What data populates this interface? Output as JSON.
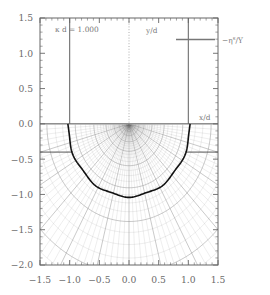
{
  "figure": {
    "kind": "scientific-plot",
    "background_color": "#ffffff",
    "frame_color": "#666666",
    "mesh_color": "#8a8a8a",
    "boundary_color": "#111111",
    "annotations": {
      "kappa_d": "κ d  =  1.000",
      "y_axis_name": "y/d",
      "x_axis_name": "x/d",
      "legend_label": "−η",
      "legend_label_sup": "s",
      "legend_label_tail": "/Y"
    }
  },
  "chart_data": {
    "type": "line",
    "title": "",
    "subtitle": "",
    "xlabel": "x/d",
    "ylabel": "y/d",
    "xlim": [
      -1.5,
      1.5
    ],
    "ylim": [
      -2.0,
      1.5
    ],
    "grid": false,
    "legend_position": "top-right",
    "legend": [
      {
        "name": "−ηˢ/Y",
        "style": "solid",
        "color": "#777777"
      }
    ],
    "axis": {
      "x_ticks": [
        -1.5,
        -1.0,
        -0.5,
        0.0,
        0.5,
        1.0,
        1.5
      ],
      "x_tick_labels": [
        "-1.5",
        "-1.0",
        "-0.5",
        "0.0",
        "0.5",
        "1.0",
        "1.5"
      ],
      "y_ticks": [
        1.5,
        1.0,
        0.5,
        0.0,
        -0.5,
        -1.0,
        -1.5,
        -2.0
      ],
      "y_tick_labels": [
        "1.5",
        "1.0",
        "0.5",
        "0.0",
        "-0.5",
        "-1.0",
        "-1.5",
        "-2.0"
      ],
      "minor_tick_step": 0.1,
      "tick_direction": "in"
    },
    "parameters": {
      "kappa_d": 1.0
    },
    "series": [
      {
        "name": "punch-edge-left",
        "type": "vertical-line",
        "x": -1.0,
        "y_from": 1.5,
        "y_to": 0.0,
        "color": "#6e6e6e"
      },
      {
        "name": "punch-edge-right",
        "type": "vertical-line",
        "x": 1.0,
        "y_from": 1.5,
        "y_to": 0.0,
        "color": "#6e6e6e"
      },
      {
        "name": "symmetry-axis",
        "type": "vertical-dotted-line",
        "x": 0.0,
        "y_from": 1.5,
        "y_to": 0.0,
        "color": "#9a9a9a"
      },
      {
        "name": "surface-line",
        "type": "horizontal-line",
        "y": 0.0,
        "x_from": -1.5,
        "x_to": 1.5,
        "color": "#555555"
      },
      {
        "name": "free-surface-step-left",
        "type": "horizontal-line",
        "y": -0.4,
        "x_from": -1.5,
        "x_to": -0.95,
        "color": "#555555"
      },
      {
        "name": "free-surface-step-right",
        "type": "horizontal-line",
        "y": -0.4,
        "x_from": 0.95,
        "x_to": 1.5,
        "color": "#555555"
      },
      {
        "name": "plastic-zone-boundary",
        "type": "semicircle",
        "center": [
          0.0,
          0.0
        ],
        "radius": 1.03,
        "span_degrees": [
          180,
          360
        ],
        "color": "#111111",
        "linewidth": 1.6
      },
      {
        "name": "polar-mesh",
        "type": "mesh",
        "region": "y < 0",
        "radial_divisions": 46,
        "angular_divisions": 60,
        "color": "#8d8d8d"
      }
    ]
  }
}
